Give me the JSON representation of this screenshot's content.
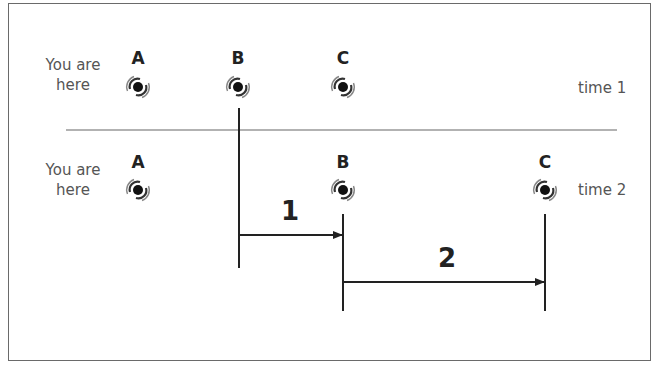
{
  "diagram": {
    "rows": [
      {
        "name": "time 1",
        "you_are_here": "You are\nhere",
        "you_are_here_lines": [
          "You are",
          "here"
        ],
        "time_label": "time 1",
        "galaxies": [
          {
            "label": "A",
            "x": 138
          },
          {
            "label": "B",
            "x": 238
          },
          {
            "label": "C",
            "x": 343
          }
        ]
      },
      {
        "name": "time 2",
        "you_are_here_lines": [
          "You are",
          "here"
        ],
        "time_label": "time 2",
        "galaxies": [
          {
            "label": "A",
            "x": 138
          },
          {
            "label": "B",
            "x": 343
          },
          {
            "label": "C",
            "x": 545
          }
        ]
      }
    ],
    "distances": [
      {
        "label": "1",
        "from": "B (time 1)",
        "to": "B (time 2)"
      },
      {
        "label": "2",
        "from": "B (time 2)",
        "to": "C (time 2)"
      }
    ],
    "icon": "spiral-galaxy-icon",
    "colors": {
      "line": "#222222",
      "divider": "#999999",
      "text": "#555555",
      "border": "#6a6a6a"
    }
  }
}
